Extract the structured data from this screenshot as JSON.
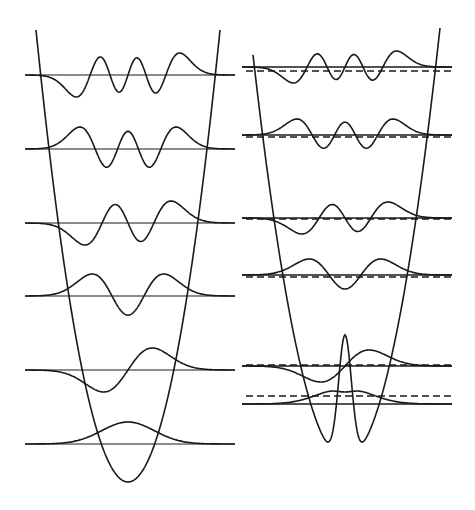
{
  "figure": {
    "colors": {
      "background": "#ffffff",
      "stroke": "#1a1a1a"
    }
  },
  "panels": [
    {
      "id": "harmonic",
      "potential": "parabola",
      "x_left": 25,
      "x_right": 235,
      "center": 128,
      "pot_top_y": 30,
      "pot_half_width_top": 92,
      "pot_bottom_y": 482,
      "levels": [
        {
          "n": 0,
          "y": 444,
          "dashed_y": null
        },
        {
          "n": 1,
          "y": 370,
          "dashed_y": null
        },
        {
          "n": 2,
          "y": 296,
          "dashed_y": null
        },
        {
          "n": 3,
          "y": 223,
          "dashed_y": null
        },
        {
          "n": 4,
          "y": 149,
          "dashed_y": null
        },
        {
          "n": 5,
          "y": 75,
          "dashed_y": null
        }
      ],
      "amplitude": 22
    },
    {
      "id": "double-well",
      "potential": "double-well",
      "x_left": 242,
      "x_right": 452,
      "center": 345,
      "pot_top_y": 28,
      "pot_bottom_y": 460,
      "barrier_y": 335,
      "levels": [
        {
          "n": 0,
          "y": 404,
          "dashed_y": 396
        },
        {
          "n": 1,
          "y": 366,
          "dashed_y": 365
        },
        {
          "n": 2,
          "y": 275,
          "dashed_y": 277
        },
        {
          "n": 3,
          "y": 218,
          "dashed_y": 219
        },
        {
          "n": 4,
          "y": 135,
          "dashed_y": 137
        },
        {
          "n": 5,
          "y": 67,
          "dashed_y": 71
        }
      ],
      "amplitude": 16
    }
  ]
}
